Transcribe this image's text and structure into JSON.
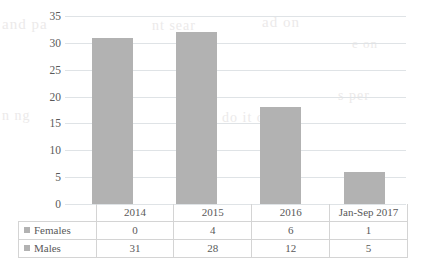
{
  "chart_data": {
    "type": "bar",
    "subtype": "stacked-column",
    "title": "",
    "subtitle": "",
    "xlabel": "",
    "ylabel": "",
    "categories": [
      "2014",
      "2015",
      "2016",
      "Jan-Sep 2017"
    ],
    "series": [
      {
        "name": "Females",
        "values": [
          0,
          4,
          6,
          1
        ],
        "color": "#b2b2b2"
      },
      {
        "name": "Males",
        "values": [
          31,
          28,
          12,
          5
        ],
        "color": "#b2b2b2"
      }
    ],
    "totals": [
      31,
      32,
      18,
      6
    ],
    "ylim": [
      0,
      35
    ],
    "ytick_step": 5,
    "ytick_labels": [
      "0",
      "5",
      "10",
      "15",
      "20",
      "25",
      "30",
      "35"
    ],
    "grid": true,
    "legend_position": "data-table-left",
    "data_table_visible": true
  },
  "data_table": {
    "header_row": [
      "",
      "2014",
      "2015",
      "2016",
      "Jan-Sep 2017"
    ],
    "rows": [
      {
        "label": "Females",
        "values": [
          "0",
          "4",
          "6",
          "1"
        ],
        "swatch": "#b2b2b2"
      },
      {
        "label": "Males",
        "values": [
          "31",
          "28",
          "12",
          "5"
        ],
        "swatch": "#b2b2b2"
      }
    ]
  },
  "colors": {
    "bar_fill": "#b2b2b2",
    "gridline": "#dfe3e6",
    "table_border": "#d4d4d4",
    "text": "#595959",
    "background": "#ffffff"
  },
  "ghost_text": [
    {
      "text": "and pa",
      "x": 2,
      "y": 16,
      "size": 15
    },
    {
      "text": "nt sear",
      "x": 152,
      "y": 18,
      "size": 14
    },
    {
      "text": "ad on",
      "x": 262,
      "y": 14,
      "size": 15
    },
    {
      "text": "e on",
      "x": 352,
      "y": 36,
      "size": 13
    },
    {
      "text": "s per",
      "x": 338,
      "y": 88,
      "size": 14
    },
    {
      "text": "n ng",
      "x": 2,
      "y": 108,
      "size": 14
    },
    {
      "text": "e can",
      "x": 92,
      "y": 112,
      "size": 14
    },
    {
      "text": "do it on",
      "x": 222,
      "y": 110,
      "size": 14
    }
  ]
}
